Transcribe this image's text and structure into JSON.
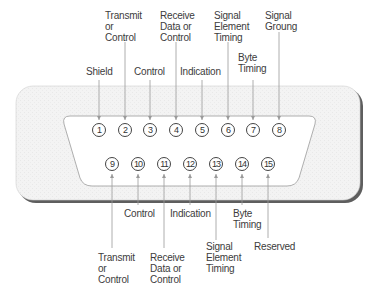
{
  "top_pins": [
    {
      "number": "1",
      "label": "Shield"
    },
    {
      "number": "2",
      "label": "Transmit\nor\nControl"
    },
    {
      "number": "3",
      "label": "Control"
    },
    {
      "number": "4",
      "label": "Receive\nData or\nControl"
    },
    {
      "number": "5",
      "label": "Indication"
    },
    {
      "number": "6",
      "label": "Signal\nElement\nTiming"
    },
    {
      "number": "7",
      "label": "Byte\nTiming"
    },
    {
      "number": "8",
      "label": "Signal\nGroung"
    }
  ],
  "bottom_pins": [
    {
      "number": "9",
      "label": "Transmit\nor\nControl"
    },
    {
      "number": "10",
      "label": "Control"
    },
    {
      "number": "11",
      "label": "Receive\nData or\nControl"
    },
    {
      "number": "12",
      "label": "Indication"
    },
    {
      "number": "13",
      "label": "Signal\nElement\nTiming"
    },
    {
      "number": "14",
      "label": "Byte\nTiming"
    },
    {
      "number": "15",
      "label": "Reserved"
    }
  ],
  "colors": {
    "body_fill": "#f2f2f2",
    "body_shadow": "#6a6a6a",
    "leader_line": "#9a9a9a",
    "text": "#3c3c3c"
  }
}
